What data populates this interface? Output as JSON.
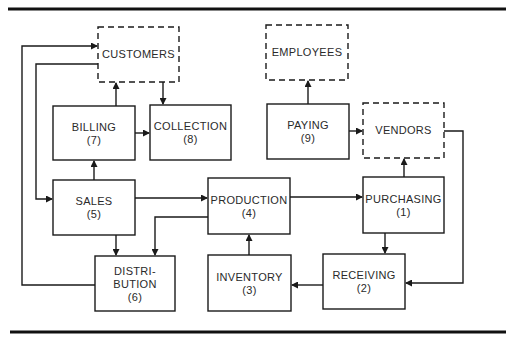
{
  "diagram": {
    "type": "flowchart",
    "external_entities": [
      {
        "id": "customers",
        "label": "CUSTOMERS"
      },
      {
        "id": "employees",
        "label": "EMPLOYEES"
      },
      {
        "id": "vendors",
        "label": "VENDORS"
      }
    ],
    "processes": [
      {
        "id": "purchasing",
        "label": "PURCHASING",
        "number": "(1)"
      },
      {
        "id": "receiving",
        "label": "RECEIVING",
        "number": "(2)"
      },
      {
        "id": "inventory",
        "label": "INVENTORY",
        "number": "(3)"
      },
      {
        "id": "production",
        "label": "PRODUCTION",
        "number": "(4)"
      },
      {
        "id": "sales",
        "label": "SALES",
        "number": "(5)"
      },
      {
        "id": "distribution",
        "label_line1": "DISTRI-",
        "label_line2": "BUTION",
        "number": "(6)"
      },
      {
        "id": "billing",
        "label": "BILLING",
        "number": "(7)"
      },
      {
        "id": "collection",
        "label": "COLLECTION",
        "number": "(8)"
      },
      {
        "id": "paying",
        "label": "PAYING",
        "number": "(9)"
      }
    ],
    "flows": [
      {
        "from": "billing",
        "to": "customers"
      },
      {
        "from": "customers",
        "to": "collection"
      },
      {
        "from": "billing",
        "to": "collection"
      },
      {
        "from": "sales",
        "to": "billing"
      },
      {
        "from": "customers",
        "to": "sales"
      },
      {
        "from": "distribution",
        "to": "customers"
      },
      {
        "from": "sales",
        "to": "production"
      },
      {
        "from": "sales",
        "to": "distribution"
      },
      {
        "from": "production",
        "to": "distribution"
      },
      {
        "from": "production",
        "to": "purchasing"
      },
      {
        "from": "inventory",
        "to": "production"
      },
      {
        "from": "receiving",
        "to": "inventory"
      },
      {
        "from": "purchasing",
        "to": "receiving"
      },
      {
        "from": "purchasing",
        "to": "vendors"
      },
      {
        "from": "vendors",
        "to": "receiving"
      },
      {
        "from": "paying",
        "to": "employees"
      },
      {
        "from": "paying",
        "to": "vendors"
      }
    ]
  }
}
